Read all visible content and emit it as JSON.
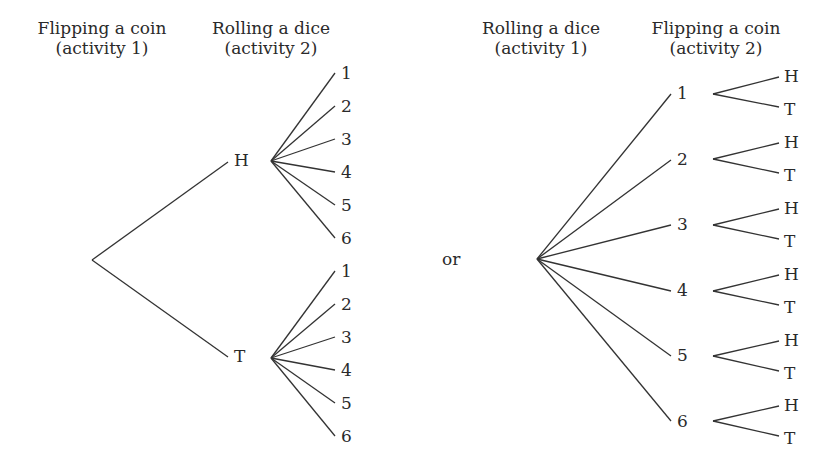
{
  "headers": {
    "left_col1": {
      "line1": "Flipping a coin",
      "line2": "(activity 1)"
    },
    "left_col2": {
      "line1": "Rolling a dice",
      "line2": "(activity 2)"
    },
    "right_col1": {
      "line1": "Rolling a dice",
      "line2": "(activity 1)"
    },
    "right_col2": {
      "line1": "Flipping a coin",
      "line2": "(activity 2)"
    }
  },
  "separator": "or",
  "left_tree": {
    "root": {
      "x": 92,
      "y": 260
    },
    "level1": [
      {
        "label": "H",
        "lx": 240,
        "ly": 166,
        "end": {
          "x": 228,
          "y": 162
        },
        "fork": {
          "x": 271,
          "y": 161
        },
        "children": [
          {
            "label": "1",
            "x": 337,
            "y": 78
          },
          {
            "label": "2",
            "x": 337,
            "y": 111
          },
          {
            "label": "3",
            "x": 337,
            "y": 144
          },
          {
            "label": "4",
            "x": 337,
            "y": 177
          },
          {
            "label": "5",
            "x": 337,
            "y": 210
          },
          {
            "label": "6",
            "x": 337,
            "y": 243
          }
        ]
      },
      {
        "label": "T",
        "lx": 240,
        "ly": 362,
        "end": {
          "x": 228,
          "y": 357
        },
        "fork": {
          "x": 271,
          "y": 358
        },
        "children": [
          {
            "label": "1",
            "x": 337,
            "y": 276
          },
          {
            "label": "2",
            "x": 337,
            "y": 309
          },
          {
            "label": "3",
            "x": 337,
            "y": 342
          },
          {
            "label": "4",
            "x": 337,
            "y": 375
          },
          {
            "label": "5",
            "x": 337,
            "y": 408
          },
          {
            "label": "6",
            "x": 337,
            "y": 441
          }
        ]
      }
    ]
  },
  "right_tree": {
    "root": {
      "x": 537,
      "y": 259
    },
    "level1": [
      {
        "label": "1",
        "end": {
          "x": 671,
          "y": 94
        },
        "lx": 683,
        "ly": 99,
        "fork": {
          "x": 713,
          "y": 94
        },
        "children": [
          {
            "label": "H",
            "x": 779,
            "y": 76
          },
          {
            "label": "T",
            "x": 779,
            "y": 109
          }
        ]
      },
      {
        "label": "2",
        "end": {
          "x": 671,
          "y": 160
        },
        "lx": 683,
        "ly": 165,
        "fork": {
          "x": 713,
          "y": 159
        },
        "children": [
          {
            "label": "H",
            "x": 779,
            "y": 142
          },
          {
            "label": "T",
            "x": 779,
            "y": 175
          }
        ]
      },
      {
        "label": "3",
        "end": {
          "x": 671,
          "y": 225
        },
        "lx": 683,
        "ly": 230,
        "fork": {
          "x": 713,
          "y": 225
        },
        "children": [
          {
            "label": "H",
            "x": 779,
            "y": 208
          },
          {
            "label": "T",
            "x": 779,
            "y": 241
          }
        ]
      },
      {
        "label": "4",
        "end": {
          "x": 671,
          "y": 291
        },
        "lx": 683,
        "ly": 296,
        "fork": {
          "x": 713,
          "y": 291
        },
        "children": [
          {
            "label": "H",
            "x": 779,
            "y": 274
          },
          {
            "label": "T",
            "x": 779,
            "y": 307
          }
        ]
      },
      {
        "label": "5",
        "end": {
          "x": 671,
          "y": 356
        },
        "lx": 683,
        "ly": 361,
        "fork": {
          "x": 713,
          "y": 356
        },
        "children": [
          {
            "label": "H",
            "x": 779,
            "y": 340
          },
          {
            "label": "T",
            "x": 779,
            "y": 373
          }
        ]
      },
      {
        "label": "6",
        "end": {
          "x": 671,
          "y": 421
        },
        "lx": 683,
        "ly": 427,
        "fork": {
          "x": 713,
          "y": 421
        },
        "children": [
          {
            "label": "H",
            "x": 779,
            "y": 405
          },
          {
            "label": "T",
            "x": 779,
            "y": 438
          }
        ]
      }
    ]
  },
  "colors": {
    "ink": "#2a2a2a",
    "line": "#333333",
    "background": "#ffffff"
  }
}
